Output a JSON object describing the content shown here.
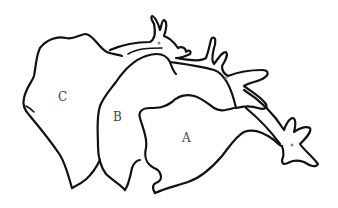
{
  "diagram": {
    "type": "line-drawing",
    "labels": [
      {
        "id": "A",
        "text": "A",
        "x": 182,
        "y": 131
      },
      {
        "id": "B",
        "text": "B",
        "x": 113,
        "y": 110
      },
      {
        "id": "C",
        "text": "C",
        "x": 58,
        "y": 90
      }
    ],
    "markers": [
      {
        "x": 159,
        "y": 43
      },
      {
        "x": 226,
        "y": 78
      },
      {
        "x": 292,
        "y": 145
      }
    ],
    "colors": {
      "stroke": "#111111",
      "label": "#444444",
      "marker": "#888888",
      "background": "#ffffff"
    }
  }
}
